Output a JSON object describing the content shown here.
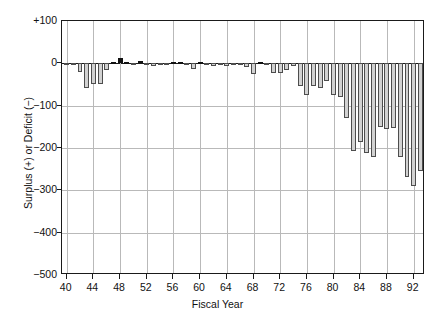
{
  "chart_data": {
    "type": "bar",
    "title": "",
    "xlabel": "Fiscal Year",
    "ylabel": "Surplus (+) or Deficit (−)",
    "ylim": [
      -500,
      100
    ],
    "xlim": [
      39.3,
      93.7
    ],
    "grid": true,
    "legend": null,
    "ytick_labels": [
      "+100",
      "0",
      "−100",
      "−200",
      "−300",
      "−400",
      "−500"
    ],
    "ytick_values": [
      100,
      0,
      -100,
      -200,
      -300,
      -400,
      -500
    ],
    "xtick_labels": [
      "40",
      "44",
      "48",
      "52",
      "56",
      "60",
      "64",
      "68",
      "72",
      "76",
      "80",
      "84",
      "88",
      "92"
    ],
    "xtick_values": [
      40,
      44,
      48,
      52,
      56,
      60,
      64,
      68,
      72,
      76,
      80,
      84,
      88,
      92
    ],
    "colors": {
      "surplus_fill": "#121212",
      "deficit_fill": "#d2d2d2",
      "bar_edge": "#4d4d4d",
      "axis": "#1a1a1a",
      "grid": "#b9b9b9",
      "background": "#ffffff"
    },
    "series_note": "Black bars = surplus (+), gray bars = deficit (−)",
    "categories": [
      40,
      41,
      42,
      43,
      44,
      45,
      46,
      47,
      48,
      49,
      50,
      51,
      52,
      53,
      54,
      55,
      56,
      57,
      58,
      59,
      60,
      61,
      62,
      63,
      64,
      65,
      66,
      67,
      68,
      69,
      70,
      71,
      72,
      73,
      74,
      75,
      76,
      77,
      78,
      79,
      80,
      81,
      82,
      83,
      84,
      85,
      86,
      87,
      88,
      89,
      90,
      91,
      92,
      93
    ],
    "values": [
      -3,
      -5,
      -21,
      -58,
      -48,
      -48,
      -48,
      -48,
      -48,
      -48,
      -48,
      -48,
      -48,
      -48,
      -48,
      -48,
      -48,
      -48,
      -48,
      -48,
      -48,
      -48,
      -48,
      -48,
      -48,
      -48,
      -48,
      -48,
      -48,
      -48,
      -48,
      -48,
      -48,
      -48,
      -48,
      -48,
      -48,
      -48,
      -48,
      -48,
      -48,
      -48,
      -48,
      -48,
      -48,
      -48,
      -48,
      -48,
      -48,
      -48,
      -48,
      -48,
      -48,
      -48
    ],
    "values_actual": [
      -3,
      -5,
      -21,
      -58,
      -48,
      -48,
      -16,
      4,
      12,
      1,
      -3,
      6,
      -2,
      -6,
      -1,
      -3,
      4,
      3,
      -3,
      -13,
      0,
      -3,
      -7,
      -5,
      -6,
      -1,
      -4,
      -9,
      -25,
      3,
      -3,
      -23,
      -23,
      -15,
      -6,
      -53,
      -74,
      -54,
      -59,
      -41,
      -74,
      -79,
      -128,
      -208,
      -185,
      -212,
      -221,
      -150,
      -155,
      -152,
      -221,
      -269,
      -290,
      -255
    ]
  }
}
